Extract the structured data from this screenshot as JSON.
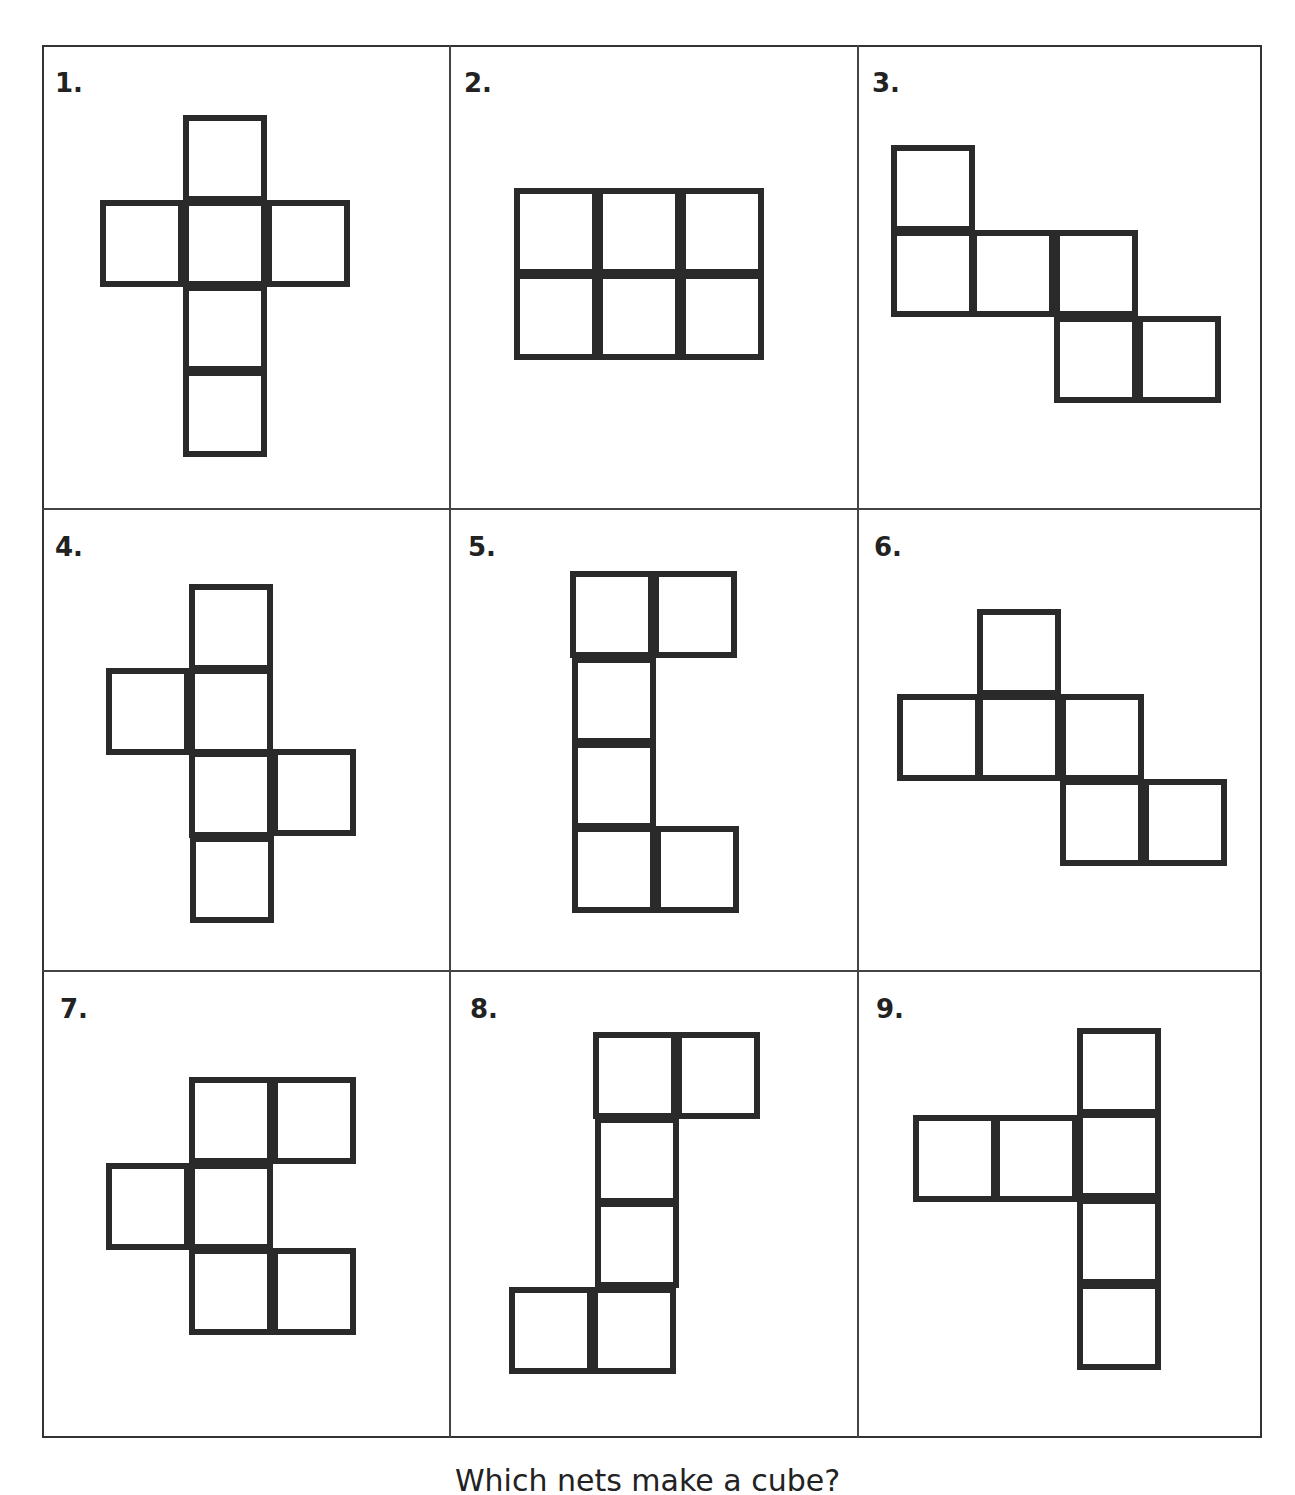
{
  "panels": [
    {
      "label": "1.",
      "label_pos": [
        55,
        68
      ],
      "squares": [
        [
          183,
          115
        ],
        [
          100,
          200
        ],
        [
          183,
          200
        ],
        [
          266,
          200
        ],
        [
          183,
          285
        ],
        [
          183,
          370
        ]
      ]
    },
    {
      "label": "2.",
      "label_pos": [
        464,
        68
      ],
      "squares": [
        [
          514,
          188
        ],
        [
          597,
          188
        ],
        [
          680,
          188
        ],
        [
          514,
          273
        ],
        [
          597,
          273
        ],
        [
          680,
          273
        ]
      ]
    },
    {
      "label": "3.",
      "label_pos": [
        872,
        68
      ],
      "squares": [
        [
          891,
          145
        ],
        [
          891,
          230
        ],
        [
          971,
          230
        ],
        [
          1054,
          230
        ],
        [
          1054,
          316
        ],
        [
          1137,
          316
        ]
      ]
    },
    {
      "label": "4.",
      "label_pos": [
        55,
        532
      ],
      "squares": [
        [
          189,
          584
        ],
        [
          106,
          668
        ],
        [
          189,
          668
        ],
        [
          189,
          751
        ],
        [
          272,
          749
        ],
        [
          190,
          836
        ]
      ]
    },
    {
      "label": "5.",
      "label_pos": [
        468,
        532
      ],
      "squares": [
        [
          570,
          571
        ],
        [
          653,
          571
        ],
        [
          572,
          657
        ],
        [
          572,
          742
        ],
        [
          572,
          826
        ],
        [
          655,
          826
        ]
      ]
    },
    {
      "label": "6.",
      "label_pos": [
        874,
        532
      ],
      "squares": [
        [
          977,
          609
        ],
        [
          897,
          694
        ],
        [
          977,
          694
        ],
        [
          1060,
          694
        ],
        [
          1060,
          779
        ],
        [
          1143,
          779
        ]
      ]
    },
    {
      "label": "7.",
      "label_pos": [
        60,
        994
      ],
      "squares": [
        [
          189,
          1077
        ],
        [
          272,
          1077
        ],
        [
          106,
          1163
        ],
        [
          189,
          1163
        ],
        [
          189,
          1248
        ],
        [
          272,
          1248
        ]
      ]
    },
    {
      "label": "8.",
      "label_pos": [
        470,
        994
      ],
      "squares": [
        [
          593,
          1032
        ],
        [
          676,
          1032
        ],
        [
          595,
          1117
        ],
        [
          595,
          1201
        ],
        [
          509,
          1287
        ],
        [
          592,
          1287
        ]
      ]
    },
    {
      "label": "9.",
      "label_pos": [
        876,
        994
      ],
      "squares": [
        [
          1077,
          1028
        ],
        [
          913,
          1115
        ],
        [
          994,
          1115
        ],
        [
          1077,
          1112
        ],
        [
          1077,
          1198
        ],
        [
          1077,
          1283
        ]
      ]
    }
  ],
  "question": "Which nets make a cube?",
  "colors": {
    "stroke": "#2a2a2a",
    "grid": "#444444",
    "background": "#ffffff"
  }
}
